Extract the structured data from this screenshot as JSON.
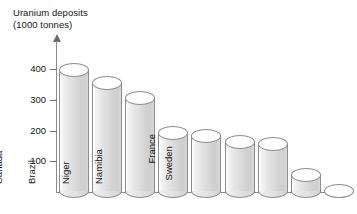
{
  "chart_data": {
    "type": "bar",
    "title": "Uranium deposits (1000 tonnes)",
    "title_line1": "Uranium deposits",
    "title_line2": "(1000 tonnes)",
    "xlabel": "",
    "ylabel": "Uranium deposits (1000 tonnes)",
    "ylim": [
      0,
      430
    ],
    "yticks": [
      100,
      200,
      300,
      400
    ],
    "ytick_labels": [
      "100",
      "200",
      "300",
      "400"
    ],
    "grid": false,
    "legend": "none",
    "style": "3d-cylinder",
    "categories": [
      "USA",
      "Australia",
      "S. Africa",
      "Canada",
      "Brazil",
      "Niger",
      "Namibia",
      "France",
      "Sweden"
    ],
    "values": [
      400,
      360,
      310,
      195,
      185,
      165,
      160,
      60,
      5
    ],
    "series": [
      {
        "name": "Uranium deposits",
        "values": [
          400,
          360,
          310,
          195,
          185,
          165,
          160,
          60,
          5
        ]
      }
    ],
    "bars": [
      {
        "label": "USA",
        "value": 400,
        "label_inside": true
      },
      {
        "label": "Australia",
        "value": 360,
        "label_inside": true
      },
      {
        "label": "S. Africa",
        "value": 310,
        "label_inside": true
      },
      {
        "label": "Canada",
        "value": 195,
        "label_inside": true
      },
      {
        "label": "Brazil",
        "value": 185,
        "label_inside": true
      },
      {
        "label": "Niger",
        "value": 165,
        "label_inside": true
      },
      {
        "label": "Namibia",
        "value": 160,
        "label_inside": true
      },
      {
        "label": "France",
        "value": 60,
        "label_inside": false
      },
      {
        "label": "Sweden",
        "value": 5,
        "label_inside": false
      }
    ],
    "colors": {
      "cylinder_fill_light": "#f2f2f2",
      "cylinder_fill_dark": "#cfcfcf",
      "cylinder_outline": "#8d8d8d",
      "axis": "#8a8a8a",
      "text": "#141414",
      "background": "#ffffff"
    }
  }
}
